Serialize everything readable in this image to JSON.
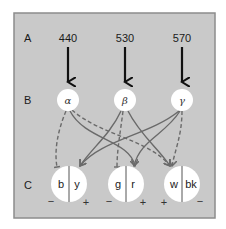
{
  "colors": {
    "panel_bg": "#c9c9c9",
    "panel_border": "#8c8c8c",
    "node_fill": "#ffffff",
    "arrow": "#111111",
    "connection": "#6a6a6a"
  },
  "rows": {
    "A": {
      "label": "A"
    },
    "B": {
      "label": "B"
    },
    "C": {
      "label": "C"
    }
  },
  "wavelengths": [
    {
      "value": "440"
    },
    {
      "value": "530"
    },
    {
      "value": "570"
    }
  ],
  "cones": [
    {
      "symbol": "α"
    },
    {
      "symbol": "β"
    },
    {
      "symbol": "γ"
    }
  ],
  "opponent_channels": [
    {
      "left": "b",
      "right": "y",
      "left_sign": "−",
      "right_sign": "+"
    },
    {
      "left": "g",
      "right": "r",
      "left_sign": "−",
      "right_sign": "+"
    },
    {
      "left": "w",
      "right": "bk",
      "left_sign": "+",
      "right_sign": "−"
    }
  ],
  "connections": [
    {
      "from": "α",
      "to": "b",
      "style": "dashed"
    },
    {
      "from": "α",
      "to": "r",
      "style": "solid"
    },
    {
      "from": "α",
      "to": "w",
      "style": "dashed"
    },
    {
      "from": "β",
      "to": "y",
      "style": "solid"
    },
    {
      "from": "β",
      "to": "g",
      "style": "dashed"
    },
    {
      "from": "β",
      "to": "w",
      "style": "solid"
    },
    {
      "from": "γ",
      "to": "y",
      "style": "solid"
    },
    {
      "from": "γ",
      "to": "r",
      "style": "solid"
    },
    {
      "from": "γ",
      "to": "w",
      "style": "dashed"
    }
  ]
}
